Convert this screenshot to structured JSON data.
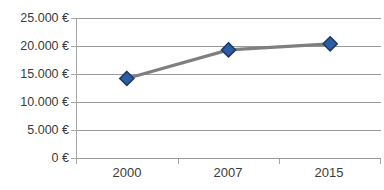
{
  "chart_data": {
    "type": "line",
    "title": "",
    "subtitle": "",
    "xlabel": "",
    "ylabel": "",
    "categories": [
      "2000",
      "2007",
      "2015"
    ],
    "values": [
      14200,
      19300,
      20400
    ],
    "series": [
      {
        "name": "",
        "values": [
          14200,
          19300,
          20400
        ],
        "marker": "diamond",
        "marker_fill": "#2a5fa8",
        "marker_border": "#1f3864",
        "line_color": "#7f7f7f"
      }
    ],
    "ylim": [
      0,
      25000
    ],
    "y_ticks": [
      0,
      5000,
      10000,
      15000,
      20000,
      25000
    ],
    "y_tick_labels": [
      "0 €",
      "5.000 €",
      "10.000 €",
      "15.000 €",
      "20.000 €",
      "25.000 €"
    ],
    "x_tick_labels": [
      "2000",
      "2007",
      "2015"
    ],
    "grid": true,
    "grid_color": "#9a9a9a",
    "legend": false,
    "legend_position": "none",
    "currency_symbol": "€",
    "thousands_separator": ".",
    "background": "#ffffff",
    "text_color": "#3b3b3b",
    "annotations": []
  },
  "axes": {
    "y_labels": [
      {
        "text": "25.000 €",
        "value": 25000
      },
      {
        "text": "20.000 €",
        "value": 20000
      },
      {
        "text": "15.000 €",
        "value": 15000
      },
      {
        "text": "10.000 €",
        "value": 10000
      },
      {
        "text": "5.000 €",
        "value": 5000
      },
      {
        "text": "0 €",
        "value": 0
      }
    ],
    "x_labels": [
      {
        "text": "2000"
      },
      {
        "text": "2007"
      },
      {
        "text": "2015"
      }
    ]
  }
}
